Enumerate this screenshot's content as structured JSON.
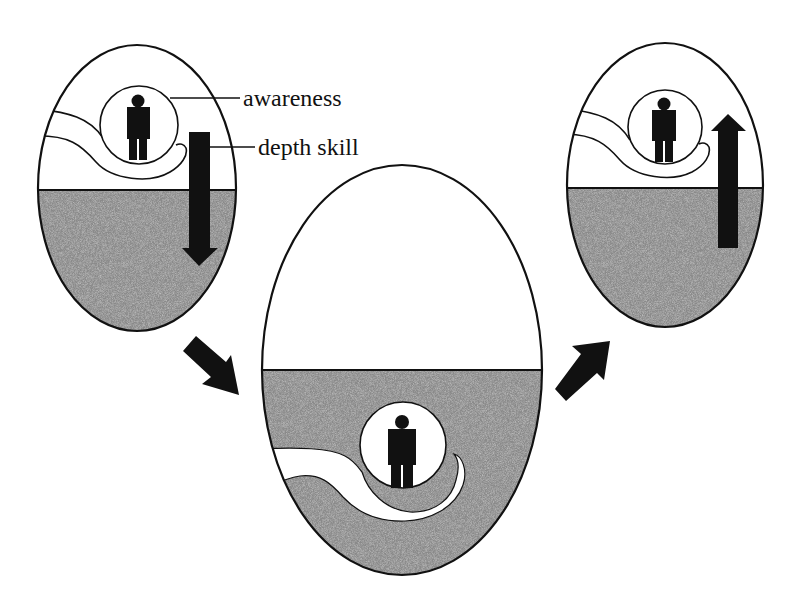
{
  "diagram": {
    "labels": {
      "awareness": "awareness",
      "depth_skill": "depth skill"
    },
    "colors": {
      "ink": "#111111",
      "water": "#8a8a8a",
      "air": "#ffffff"
    },
    "stages": [
      {
        "id": "left",
        "description": "awareness above surface, depth skill pushing downward",
        "arrow": "down"
      },
      {
        "id": "center",
        "description": "awareness submerged below surface",
        "arrow": "none"
      },
      {
        "id": "right",
        "description": "awareness returned above surface, depth skill pulling upward",
        "arrow": "up"
      }
    ],
    "transitions": [
      {
        "from": "left",
        "to": "center",
        "direction": "down-right"
      },
      {
        "from": "center",
        "to": "right",
        "direction": "up-right"
      }
    ]
  }
}
